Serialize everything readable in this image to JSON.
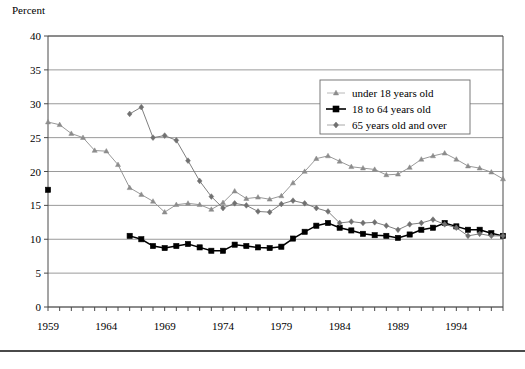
{
  "figure": {
    "axis_title": "Percent",
    "has_bottom_rule": true
  },
  "chart_data": {
    "type": "line",
    "title": "",
    "subtitle": "",
    "xlabel": "",
    "ylabel": "Percent",
    "ylim": [
      0,
      40
    ],
    "xlim": [
      1959,
      1998
    ],
    "ytick_labels": [
      "0",
      "5",
      "10",
      "15",
      "20",
      "25",
      "30",
      "35",
      "40"
    ],
    "yticks": [
      0,
      5,
      10,
      15,
      20,
      25,
      30,
      35,
      40
    ],
    "xtick_labels": [
      "1959",
      "1964",
      "1969",
      "1974",
      "1979",
      "1984",
      "1989",
      "1994"
    ],
    "xticks": [
      1959,
      1964,
      1969,
      1974,
      1979,
      1984,
      1989,
      1994
    ],
    "x_minor_tick_step": 1,
    "grid": "horizontal",
    "legend_position": "upper-right-inside",
    "colors": {
      "under18": "#8c8c8c",
      "adults": "#000000",
      "seniors": "#707070",
      "gridline": "#808080",
      "axis": "#4a4a4a",
      "legend_border": "#6a6a6a",
      "background": "#ffffff"
    },
    "series": [
      {
        "name": "under 18 years old",
        "marker": "triangle",
        "color": "#8c8c8c",
        "x": [
          1959,
          1960,
          1961,
          1962,
          1963,
          1964,
          1965,
          1966,
          1967,
          1968,
          1969,
          1970,
          1971,
          1972,
          1973,
          1974,
          1975,
          1976,
          1977,
          1978,
          1979,
          1980,
          1981,
          1982,
          1983,
          1984,
          1985,
          1986,
          1987,
          1988,
          1989,
          1990,
          1991,
          1992,
          1993,
          1994,
          1995,
          1996,
          1997,
          1998
        ],
        "values": [
          27.3,
          26.9,
          25.6,
          25.0,
          23.1,
          23.0,
          21.0,
          17.6,
          16.6,
          15.6,
          14.0,
          15.1,
          15.3,
          15.1,
          14.4,
          15.4,
          17.1,
          16.0,
          16.2,
          15.9,
          16.4,
          18.3,
          20.0,
          21.9,
          22.3,
          21.5,
          20.7,
          20.5,
          20.3,
          19.5,
          19.6,
          20.6,
          21.8,
          22.3,
          22.7,
          21.8,
          20.8,
          20.5,
          19.9,
          18.9
        ]
      },
      {
        "name": "18 to 64 years old",
        "marker": "square",
        "color": "#000000",
        "x": [
          1959,
          1966,
          1967,
          1968,
          1969,
          1970,
          1971,
          1972,
          1973,
          1974,
          1975,
          1976,
          1977,
          1978,
          1979,
          1980,
          1981,
          1982,
          1983,
          1984,
          1985,
          1986,
          1987,
          1988,
          1989,
          1990,
          1991,
          1992,
          1993,
          1994,
          1995,
          1996,
          1997,
          1998
        ],
        "values": [
          17.3,
          10.5,
          10.0,
          9.0,
          8.7,
          9.0,
          9.3,
          8.8,
          8.3,
          8.3,
          9.2,
          9.0,
          8.8,
          8.7,
          8.9,
          10.1,
          11.1,
          12.0,
          12.4,
          11.7,
          11.3,
          10.8,
          10.6,
          10.5,
          10.2,
          10.7,
          11.4,
          11.7,
          12.4,
          11.9,
          11.4,
          11.4,
          10.9,
          10.5
        ]
      },
      {
        "name": "65 years old and over",
        "marker": "diamond",
        "color": "#707070",
        "x": [
          1966,
          1967,
          1968,
          1969,
          1970,
          1971,
          1972,
          1973,
          1974,
          1975,
          1976,
          1977,
          1978,
          1979,
          1980,
          1981,
          1982,
          1983,
          1984,
          1985,
          1986,
          1987,
          1988,
          1989,
          1990,
          1991,
          1992,
          1993,
          1994,
          1995,
          1996,
          1997,
          1998
        ],
        "values": [
          28.5,
          29.5,
          25.0,
          25.3,
          24.6,
          21.6,
          18.6,
          16.3,
          14.6,
          15.3,
          15.0,
          14.1,
          14.0,
          15.2,
          15.7,
          15.3,
          14.6,
          14.1,
          12.4,
          12.6,
          12.4,
          12.5,
          12.0,
          11.4,
          12.2,
          12.4,
          12.9,
          12.2,
          11.7,
          10.5,
          10.8,
          10.5,
          10.5
        ]
      }
    ]
  }
}
